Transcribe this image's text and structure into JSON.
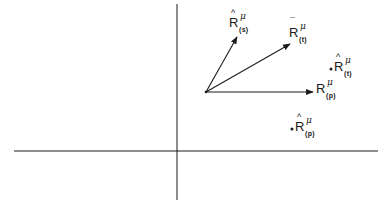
{
  "diagram": {
    "colors": {
      "ink": "#1a1a1a",
      "background": "#ffffff"
    },
    "axes": {
      "horizontal": {
        "x1": 14,
        "y1": 151,
        "x2": 378,
        "y2": 151
      },
      "vertical": {
        "x1": 177,
        "y1": 4,
        "x2": 177,
        "y2": 200
      }
    },
    "origin": {
      "x": 206,
      "y": 92
    },
    "vectors": [
      {
        "id": "R_hat_s",
        "tip": {
          "x": 237,
          "y": 37
        }
      },
      {
        "id": "R_bar_t",
        "tip": {
          "x": 290,
          "y": 44
        }
      },
      {
        "id": "R_p",
        "tip": {
          "x": 313,
          "y": 92
        }
      }
    ],
    "points": [
      {
        "id": "R_hat_t",
        "x": 331,
        "y": 69
      },
      {
        "id": "R_hat_p",
        "x": 292,
        "y": 129
      }
    ],
    "labels": [
      {
        "id": "R_hat_s",
        "base": "R",
        "accent": "^",
        "sup": "μ",
        "sub": "(s)"
      },
      {
        "id": "R_bar_t",
        "base": "R",
        "accent": "¯",
        "sup": "μ",
        "sub": "(t)"
      },
      {
        "id": "R_p",
        "base": "R",
        "accent": "",
        "sup": "μ",
        "sub": "(p)"
      },
      {
        "id": "R_hat_t",
        "base": "R",
        "accent": "^",
        "sup": "μ",
        "sub": "(t)"
      },
      {
        "id": "R_hat_p",
        "base": "R",
        "accent": "^",
        "sup": "μ",
        "sub": "(p)"
      }
    ]
  }
}
